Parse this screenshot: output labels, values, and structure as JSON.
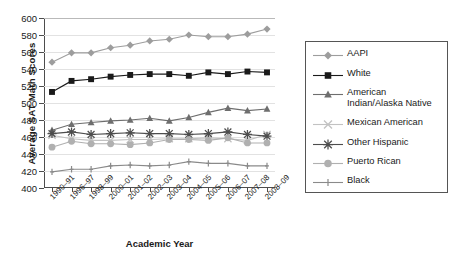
{
  "chart_data": {
    "type": "line",
    "title": "",
    "xlabel": "Academic Year",
    "ylabel": "Average  SAT Math Scores",
    "ylim": [
      400,
      600
    ],
    "ytick_step": 20,
    "yticks": [
      "600",
      "580",
      "560",
      "540",
      "520",
      "500",
      "480",
      "460",
      "440",
      "420",
      "400"
    ],
    "grid": "horizontal",
    "legend_position": "right",
    "categories": [
      "1990–91",
      "1996–97",
      "1998–99",
      "2000–01",
      "2001–02",
      "2002–03",
      "2003–04",
      "2004–05",
      "2005–06",
      "2006–07",
      "2007–08",
      "2008–09"
    ],
    "series": [
      {
        "name": "AAPI",
        "marker": "diamond",
        "color": "#9d9d9d",
        "line": "#9d9d9d",
        "values": [
          548,
          559,
          559,
          565,
          568,
          573,
          575,
          580,
          578,
          578,
          581,
          587
        ]
      },
      {
        "name": "White",
        "marker": "square",
        "color": "#1a1a1a",
        "line": "#1a1a1a",
        "values": [
          513,
          526,
          528,
          531,
          533,
          534,
          534,
          532,
          536,
          534,
          537,
          536
        ]
      },
      {
        "name": "American\nIndian/Alaska Native",
        "marker": "triangle",
        "color": "#6e6e6e",
        "line": "#6e6e6e",
        "values": [
          468,
          475,
          477,
          479,
          480,
          482,
          479,
          483,
          489,
          494,
          491,
          493
        ]
      },
      {
        "name": "Mexican American",
        "marker": "cross",
        "color": "#c2c2c2",
        "line": "#c2c2c2",
        "values": [
          462,
          458,
          456,
          456,
          457,
          457,
          458,
          458,
          459,
          458,
          456,
          463
        ]
      },
      {
        "name": "Other Hispanic",
        "marker": "asterisk",
        "color": "#4d4d4d",
        "line": "#4d4d4d",
        "values": [
          464,
          466,
          463,
          464,
          465,
          464,
          464,
          463,
          464,
          466,
          463,
          461
        ]
      },
      {
        "name": "Puerto Rican",
        "marker": "circle",
        "color": "#b0b0b0",
        "line": "#b0b0b0",
        "values": [
          448,
          455,
          452,
          452,
          451,
          453,
          457,
          457,
          456,
          459,
          453,
          453
        ]
      },
      {
        "name": "Black",
        "marker": "plus",
        "color": "#8a8a8a",
        "line": "#8a8a8a",
        "values": [
          419,
          422,
          422,
          426,
          427,
          426,
          427,
          431,
          429,
          429,
          426,
          426
        ]
      }
    ]
  },
  "legend": {
    "items": [
      {
        "label": "AAPI"
      },
      {
        "label": "White"
      },
      {
        "label": "American\nIndian/Alaska Native"
      },
      {
        "label": "Mexican American"
      },
      {
        "label": "Other Hispanic"
      },
      {
        "label": "Puerto Rican"
      },
      {
        "label": "Black"
      }
    ]
  }
}
